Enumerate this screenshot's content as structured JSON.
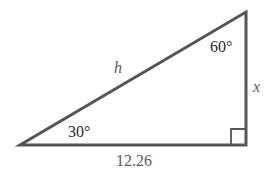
{
  "diagram": {
    "type": "right-triangle",
    "colors": {
      "stroke": "#555555",
      "text_dark": "#2a2a2a",
      "text_grey": "#5a5a5a"
    },
    "vertices": {
      "left": [
        20,
        145
      ],
      "bottom_right": [
        246,
        145
      ],
      "top_right": [
        246,
        12
      ]
    },
    "labels": {
      "angle_left": "30°",
      "angle_top": "60°",
      "hypotenuse": "h",
      "vertical_leg": "x",
      "base": "12.26"
    },
    "right_angle_marker": true
  }
}
